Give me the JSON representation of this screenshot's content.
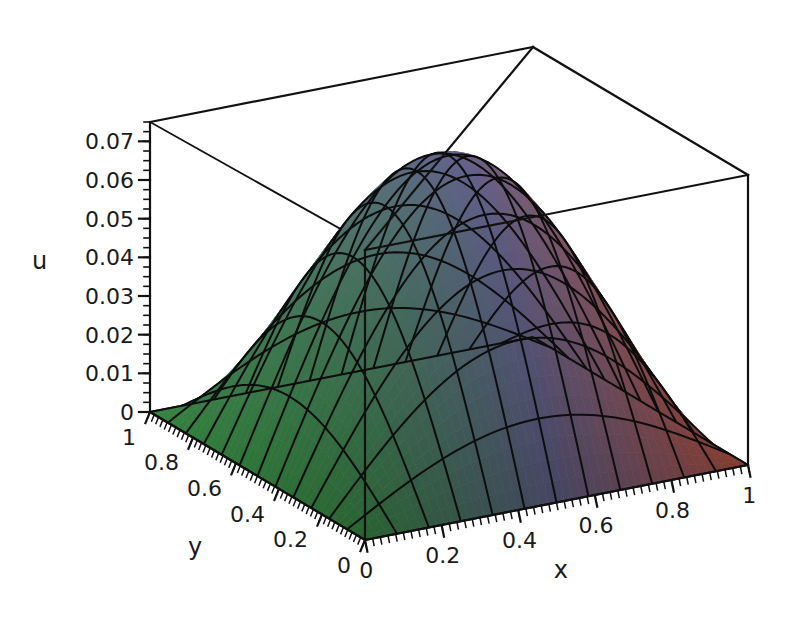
{
  "figure": {
    "kind": "surface-plot-3d",
    "background_color": "#ffffff",
    "line_color": "#111111"
  },
  "axes": {
    "z": {
      "name": "u",
      "ticks": [
        "0.07",
        "0.06",
        "0.05",
        "0.04",
        "0.03",
        "0.02",
        "0.01",
        "0"
      ]
    },
    "y": {
      "name": "y",
      "ticks": [
        "1",
        "0.8",
        "0.6",
        "0.4",
        "0.2",
        "0"
      ]
    },
    "x": {
      "name": "x",
      "ticks": [
        "0",
        "0.2",
        "0.4",
        "0.6",
        "0.8",
        "1"
      ]
    }
  },
  "chart_data": {
    "type": "surface",
    "title": "",
    "xlabel": "x",
    "ylabel": "y",
    "zlabel": "u",
    "xlim": [
      0,
      1
    ],
    "ylim": [
      0,
      1
    ],
    "zlim": [
      0,
      0.075
    ],
    "xticks": [
      0,
      0.2,
      0.4,
      0.6,
      0.8,
      1
    ],
    "yticks": [
      0,
      0.2,
      0.4,
      0.6,
      0.8,
      1
    ],
    "zticks": [
      0,
      0.01,
      0.02,
      0.03,
      0.04,
      0.05,
      0.06,
      0.07
    ],
    "grid": false,
    "legend": "none",
    "colormap": "green-to-blue-to-red (by x)",
    "peak": {
      "x": 0.5,
      "y": 0.5,
      "u": 0.0732
    },
    "boundary_value": 0,
    "surface_formula": "u(x,y) = 0.0732 * sin(pi*x) * sin(pi*y)",
    "mesh_divisions": {
      "x": 12,
      "y": 12
    },
    "sample_x": [
      0,
      0.1,
      0.2,
      0.3,
      0.4,
      0.5,
      0.6,
      0.7,
      0.8,
      0.9,
      1.0
    ],
    "sample_y": [
      0,
      0.1,
      0.2,
      0.3,
      0.4,
      0.5,
      0.6,
      0.7,
      0.8,
      0.9,
      1.0
    ],
    "z_matrix": [
      [
        0,
        0,
        0,
        0,
        0,
        0,
        0,
        0,
        0,
        0,
        0
      ],
      [
        0,
        0.007,
        0.0133,
        0.0183,
        0.0215,
        0.0226,
        0.0215,
        0.0183,
        0.0133,
        0.007,
        0
      ],
      [
        0,
        0.0133,
        0.0252,
        0.0347,
        0.0408,
        0.043,
        0.0408,
        0.0347,
        0.0252,
        0.0133,
        0
      ],
      [
        0,
        0.0183,
        0.0347,
        0.0478,
        0.0562,
        0.0592,
        0.0562,
        0.0478,
        0.0347,
        0.0183,
        0
      ],
      [
        0,
        0.0215,
        0.0408,
        0.0562,
        0.0661,
        0.0696,
        0.0661,
        0.0562,
        0.0408,
        0.0215,
        0
      ],
      [
        0,
        0.0226,
        0.043,
        0.0592,
        0.0696,
        0.0732,
        0.0696,
        0.0592,
        0.043,
        0.0226,
        0
      ],
      [
        0,
        0.0215,
        0.0408,
        0.0562,
        0.0661,
        0.0696,
        0.0661,
        0.0562,
        0.0408,
        0.0215,
        0
      ],
      [
        0,
        0.0183,
        0.0347,
        0.0478,
        0.0562,
        0.0592,
        0.0562,
        0.0478,
        0.0347,
        0.0183,
        0
      ],
      [
        0,
        0.0133,
        0.0252,
        0.0347,
        0.0408,
        0.043,
        0.0408,
        0.0347,
        0.0252,
        0.0133,
        0
      ],
      [
        0,
        0.007,
        0.0133,
        0.0183,
        0.0215,
        0.0226,
        0.0215,
        0.0183,
        0.0133,
        0.007,
        0
      ],
      [
        0,
        0,
        0,
        0,
        0,
        0,
        0,
        0,
        0,
        0,
        0
      ]
    ],
    "colors": {
      "low_x": "#3f9e4d",
      "mid_x": "#6f6f9e",
      "high_x": "#d4604f",
      "apex": "#8a86b5"
    }
  }
}
